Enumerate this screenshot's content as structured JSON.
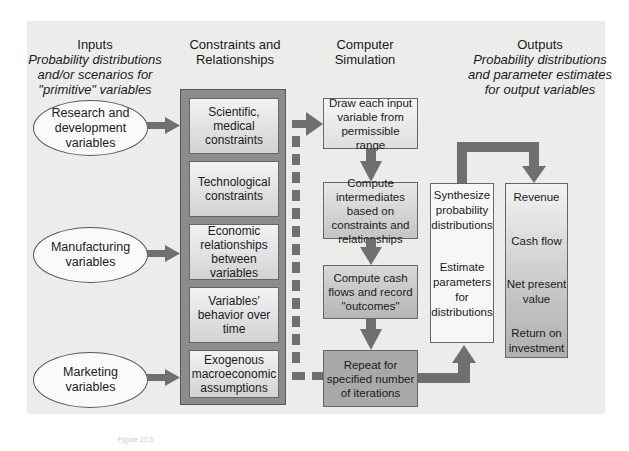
{
  "headers": {
    "inputs": {
      "title": "Inputs",
      "subtitle_line1": "Probability distributions",
      "subtitle_line2": "and/or scenarios for",
      "subtitle_line3": "\"primitive\" variables"
    },
    "constraints": {
      "line1": "Constraints and",
      "line2": "Relationships"
    },
    "simulation": {
      "line1": "Computer",
      "line2": "Simulation"
    },
    "outputs": {
      "title": "Outputs",
      "subtitle_line1": "Probability distributions",
      "subtitle_line2": "and parameter estimates",
      "subtitle_line3": "for output variables"
    }
  },
  "inputs": [
    {
      "line1": "Research and",
      "line2": "development",
      "line3": "variables"
    },
    {
      "line1": "Manufacturing",
      "line2": "variables"
    },
    {
      "line1": "Marketing",
      "line2": "variables"
    }
  ],
  "constraints": [
    {
      "label": "Scientific, medical constraints"
    },
    {
      "label": "Technological constraints"
    },
    {
      "label": "Economic relationships between variables"
    },
    {
      "label": "Variables' behavior over time"
    },
    {
      "label": "Exogenous macroeconomic assumptions"
    }
  ],
  "simulation_steps": [
    {
      "label": "Draw each input variable from permissible range"
    },
    {
      "label": "Compute intermediates based on constraints and relationships"
    },
    {
      "label": "Compute cash flows and record \"outcomes\""
    },
    {
      "label": "Repeat for specified number of iterations"
    }
  ],
  "synthesis": {
    "line1": "Synthesize",
    "line2": "probability",
    "line3": "distributions",
    "line4": "Estimate",
    "line5": "parameters",
    "line6": "for",
    "line7": "distributions"
  },
  "outputs": [
    {
      "line1": "Revenue"
    },
    {
      "line1": "Cash flow"
    },
    {
      "line1": "Net present",
      "line2": "value"
    },
    {
      "line1": "Return on",
      "line2": "investment"
    }
  ],
  "caption": "Figure 10.5",
  "colors": {
    "arrow": "#6f6f6f",
    "container": "#8c8c8c",
    "panel": "#ececea"
  }
}
